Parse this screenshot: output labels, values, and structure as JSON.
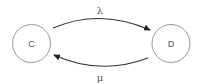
{
  "diagram": {
    "type": "state-transition",
    "nodes": [
      {
        "id": "C",
        "label": "C"
      },
      {
        "id": "D",
        "label": "D"
      }
    ],
    "edges": [
      {
        "from": "C",
        "to": "D",
        "label": "λ"
      },
      {
        "from": "D",
        "to": "C",
        "label": "μ"
      }
    ]
  },
  "colors": {
    "node_stroke": "#9a9a9a",
    "edge_stroke": "#333333",
    "text": "#555555"
  }
}
